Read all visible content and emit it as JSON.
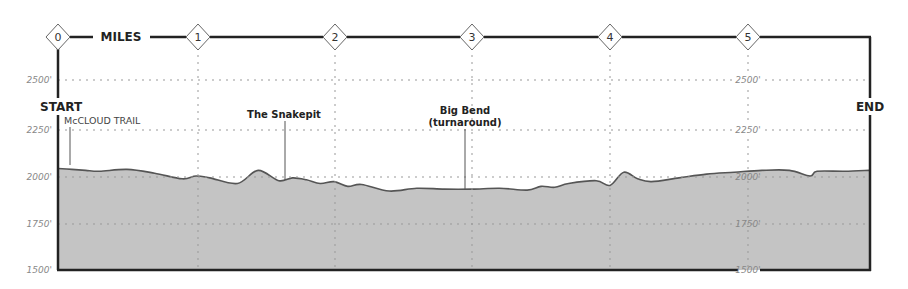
{
  "chart_data": {
    "type": "area",
    "title": "",
    "xlabel": "MILES",
    "ylabel": "Elevation (ft)",
    "x_ticks": [
      0,
      1,
      2,
      3,
      4,
      5
    ],
    "y_ticks": [
      "1500'",
      "1750'",
      "2000'",
      "2250'",
      "2500'"
    ],
    "y_tick_values": [
      1500,
      1750,
      2000,
      2250,
      2500
    ],
    "xlim": [
      0,
      5.88
    ],
    "ylim": [
      1500,
      2650
    ],
    "grid": true,
    "x": [
      0,
      0.1,
      0.2,
      0.3,
      0.5,
      0.7,
      0.9,
      1.0,
      1.1,
      1.3,
      1.45,
      1.6,
      1.7,
      1.8,
      1.9,
      2.0,
      2.1,
      2.2,
      2.4,
      2.6,
      2.8,
      3.0,
      3.2,
      3.4,
      3.5,
      3.6,
      3.7,
      3.9,
      4.0,
      4.1,
      4.2,
      4.3,
      4.5,
      4.7,
      4.9,
      5.1,
      5.3,
      5.45,
      5.5,
      5.7,
      5.88
    ],
    "elevation": [
      2040,
      2035,
      2030,
      2025,
      2035,
      2015,
      1985,
      2000,
      1990,
      1960,
      2030,
      1975,
      1990,
      1980,
      1960,
      1970,
      1945,
      1955,
      1920,
      1935,
      1930,
      1930,
      1935,
      1925,
      1945,
      1940,
      1960,
      1975,
      1950,
      2020,
      1985,
      1970,
      1990,
      2010,
      2020,
      2030,
      2030,
      2000,
      2025,
      2025,
      2030
    ],
    "annotations": [
      {
        "text": "START",
        "x": 0
      },
      {
        "text": "McCLOUD TRAIL",
        "x": 0.1
      },
      {
        "text": "The Snakepit",
        "x": 1.65
      },
      {
        "text": "Big Bend (turnaround)",
        "x": 2.95
      },
      {
        "text": "END",
        "x": 5.88
      }
    ]
  },
  "labels": {
    "miles": "MILES",
    "start": "START",
    "end": "END",
    "mccloud": "McCLOUD TRAIL",
    "snakepit": "The Snakepit",
    "bigbend_1": "Big Bend",
    "bigbend_2": "(turnaround)",
    "markers": [
      "0",
      "1",
      "2",
      "3",
      "4",
      "5"
    ],
    "yleft": [
      "2500'",
      "2250'",
      "2000'",
      "1750'",
      "1500'"
    ],
    "ymid": [
      "2500'",
      "2250'",
      "2000'",
      "1750'",
      "1500'"
    ]
  },
  "colors": {
    "fill": "#c4c4c4",
    "line": "#555555",
    "frame": "#222222",
    "grid": "#aaaaaa"
  }
}
